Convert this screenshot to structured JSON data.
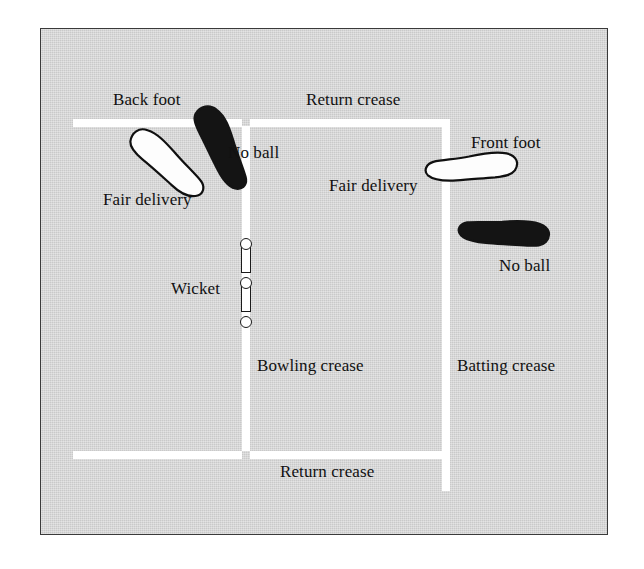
{
  "diagram": {
    "colors": {
      "pitch_background": "#c9c9c9",
      "crease_line": "#ffffff",
      "fair_delivery_foot": "#fdfdfd",
      "no_ball_foot": "#141414",
      "text": "#111111",
      "border": "#3a3a3a"
    },
    "labels": {
      "back_foot": "Back foot",
      "return_crease_top": "Return crease",
      "no_ball_left": "No ball",
      "fair_delivery_left": "Fair delivery",
      "front_foot": "Front foot",
      "fair_delivery_right": "Fair delivery",
      "no_ball_right": "No ball",
      "wicket": "Wicket",
      "bowling_crease": "Bowling crease",
      "batting_crease": "Batting crease",
      "return_crease_bottom": "Return crease"
    },
    "creases": [
      {
        "name": "return-crease-top",
        "orientation": "horizontal"
      },
      {
        "name": "return-crease-bottom",
        "orientation": "horizontal"
      },
      {
        "name": "bowling-crease",
        "orientation": "vertical"
      },
      {
        "name": "batting-crease",
        "orientation": "vertical"
      }
    ],
    "wicket": {
      "stump_count": 3,
      "bail_count": 2
    },
    "footprints": [
      {
        "name": "back-foot-no-ball",
        "legality": "No ball",
        "fill": "black"
      },
      {
        "name": "back-foot-fair-delivery",
        "legality": "Fair delivery",
        "fill": "white"
      },
      {
        "name": "front-foot-fair-delivery",
        "legality": "Fair delivery",
        "fill": "white"
      },
      {
        "name": "front-foot-no-ball",
        "legality": "No ball",
        "fill": "black"
      }
    ]
  }
}
